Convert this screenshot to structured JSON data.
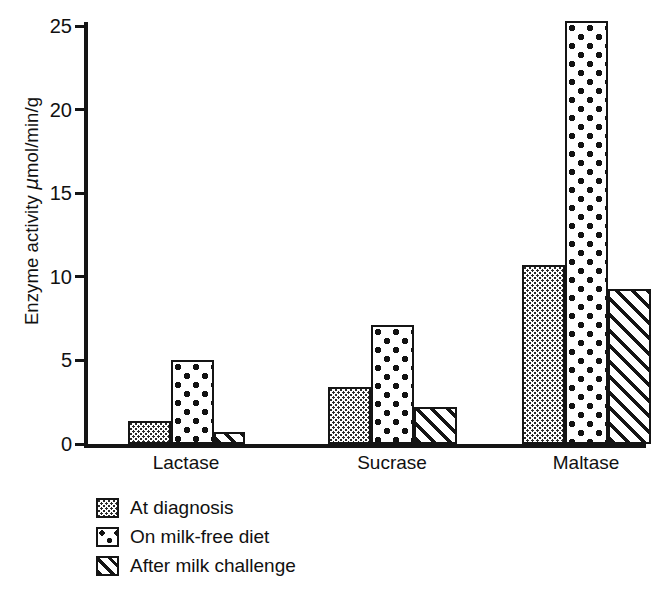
{
  "chart_data": {
    "type": "bar",
    "title": "",
    "subtitle": "",
    "xlabel": "",
    "ylabel": "Enzyme activity μmol/min/g",
    "ylabel_parts": {
      "prefix": "Enzyme activity ",
      "mu": "μ",
      "suffix": "mol/min/g"
    },
    "categories": [
      "Lactase",
      "Sucrase",
      "Maltase"
    ],
    "series": [
      {
        "name": "At diagnosis",
        "pattern": "stipple",
        "values": [
          1.4,
          3.4,
          10.7
        ]
      },
      {
        "name": "On milk-free diet",
        "pattern": "dots",
        "values": [
          5.0,
          7.1,
          25.3
        ]
      },
      {
        "name": "After milk challenge",
        "pattern": "hatch",
        "values": [
          0.7,
          2.2,
          9.3
        ]
      }
    ],
    "ylim": [
      0,
      25
    ],
    "yticks": [
      0,
      5,
      10,
      15,
      20,
      25
    ],
    "ytick_labels": [
      "0",
      "5",
      "10",
      "15",
      "20",
      "25"
    ],
    "grid": false,
    "legend_position": "below-left",
    "axis_color": "#151515",
    "background_color": "#ffffff"
  },
  "legend": {
    "items": [
      {
        "label": "At diagnosis",
        "pattern": "stipple"
      },
      {
        "label": "On milk-free diet",
        "pattern": "dots"
      },
      {
        "label": "After milk challenge",
        "pattern": "hatch"
      }
    ]
  }
}
